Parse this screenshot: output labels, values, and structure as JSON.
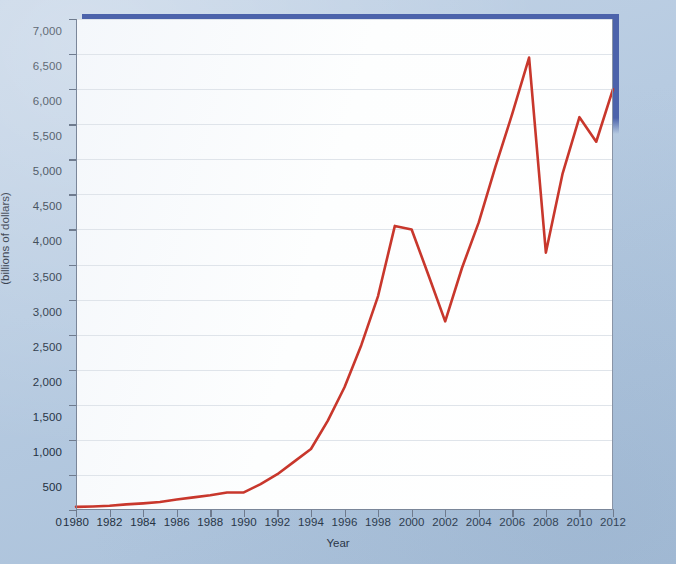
{
  "figure": {
    "background_color": "#b4c8de",
    "plot_background_color": "#ffffff",
    "frame_accent_color": "#4c63ab",
    "line_color": "#c8372c",
    "gridline_color": "#dfe4ea",
    "axis_color": "#7a8699"
  },
  "chart_data": {
    "type": "line",
    "title": "",
    "xlabel": "Year",
    "ylabel": "Value of stocks owned through equity mutual funds (billions of dollars)",
    "ylabel_line1": "Value of stocks owned through equity mutual funds",
    "ylabel_line2": "(billions of dollars)",
    "xlim": [
      1980,
      2012
    ],
    "ylim": [
      0,
      7000
    ],
    "grid": true,
    "legend": "none",
    "x_tick_labels": [
      "1980",
      "1982",
      "1984",
      "1986",
      "1988",
      "1990",
      "1992",
      "1994",
      "1996",
      "1998",
      "2000",
      "2002",
      "2004",
      "2006",
      "2008",
      "2010",
      "2012"
    ],
    "x_ticks": [
      1980,
      1982,
      1984,
      1986,
      1988,
      1990,
      1992,
      1994,
      1996,
      1998,
      2000,
      2002,
      2004,
      2006,
      2008,
      2010,
      2012
    ],
    "y_tick_labels": [
      "0",
      "500",
      "1,000",
      "1,500",
      "2,000",
      "2,500",
      "3,000",
      "3,500",
      "4,000",
      "4,500",
      "5,000",
      "5,500",
      "6,000",
      "6,500",
      "7,000"
    ],
    "y_ticks": [
      0,
      500,
      1000,
      1500,
      2000,
      2500,
      3000,
      3500,
      4000,
      4500,
      5000,
      5500,
      6000,
      6500,
      7000
    ],
    "x": [
      1980,
      1981,
      1982,
      1983,
      1984,
      1985,
      1986,
      1987,
      1988,
      1989,
      1990,
      1991,
      1992,
      1993,
      1994,
      1995,
      1996,
      1997,
      1998,
      1999,
      2000,
      2001,
      2002,
      2003,
      2004,
      2005,
      2006,
      2007,
      2008,
      2009,
      2010,
      2011,
      2012
    ],
    "values": [
      45,
      50,
      60,
      80,
      95,
      115,
      150,
      180,
      210,
      250,
      250,
      370,
      510,
      690,
      870,
      1270,
      1750,
      2350,
      3050,
      4050,
      4000,
      3350,
      2690,
      3450,
      4100,
      4900,
      5650,
      6450,
      3670,
      4800,
      5600,
      5250,
      6000
    ],
    "series": [
      {
        "name": "Value of stocks owned through equity mutual funds",
        "color": "#c8372c",
        "values": [
          45,
          50,
          60,
          80,
          95,
          115,
          150,
          180,
          210,
          250,
          250,
          370,
          510,
          690,
          870,
          1270,
          1750,
          2350,
          3050,
          4050,
          4000,
          3350,
          2690,
          3450,
          4100,
          4900,
          5650,
          6450,
          3670,
          4800,
          5600,
          5250,
          6000
        ]
      }
    ]
  }
}
